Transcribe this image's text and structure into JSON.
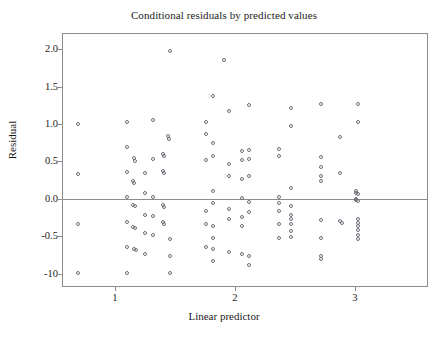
{
  "chart_data": {
    "type": "scatter",
    "title": "Conditional residuals by predicted values",
    "xlabel": "Linear predictor",
    "ylabel": "Residual",
    "xlim": [
      0.56,
      3.61
    ],
    "ylim": [
      -1.18,
      2.22
    ],
    "grid": false,
    "legend": null,
    "xticks": [
      1,
      2,
      3
    ],
    "xtick_labels": [
      "1",
      "2",
      "3"
    ],
    "yticks": [
      2.0,
      1.5,
      1.0,
      0.5,
      0.0,
      -0.5,
      -1.0
    ],
    "ytick_labels": [
      "2.0",
      "1.5",
      "1.0",
      "0.5",
      "0.0",
      "-0.5",
      "-10"
    ],
    "reference_lines": [
      {
        "orientation": "horizontal",
        "y": 0.0
      }
    ],
    "marker": "open-circle",
    "marker_color": "#6e6e78",
    "points": [
      [
        0.69,
        1.0
      ],
      [
        0.69,
        0.33
      ],
      [
        0.69,
        -0.33
      ],
      [
        0.69,
        -0.99
      ],
      [
        1.1,
        1.03
      ],
      [
        1.1,
        0.69
      ],
      [
        1.1,
        0.36
      ],
      [
        1.1,
        0.02
      ],
      [
        1.1,
        -0.31
      ],
      [
        1.1,
        -0.65
      ],
      [
        1.1,
        -0.99
      ],
      [
        1.16,
        0.55
      ],
      [
        1.17,
        0.51
      ],
      [
        1.15,
        0.24
      ],
      [
        1.16,
        0.21
      ],
      [
        1.15,
        -0.08
      ],
      [
        1.17,
        -0.09
      ],
      [
        1.15,
        -0.38
      ],
      [
        1.17,
        -0.39
      ],
      [
        1.16,
        -0.67
      ],
      [
        1.18,
        -0.68
      ],
      [
        1.25,
        0.35
      ],
      [
        1.25,
        0.08
      ],
      [
        1.25,
        -0.21
      ],
      [
        1.25,
        -0.46
      ],
      [
        1.25,
        -0.74
      ],
      [
        1.32,
        1.05
      ],
      [
        1.32,
        0.54
      ],
      [
        1.32,
        0.02
      ],
      [
        1.32,
        -0.23
      ],
      [
        1.32,
        -0.48
      ],
      [
        1.4,
        0.6
      ],
      [
        1.4,
        0.37
      ],
      [
        1.4,
        -0.08
      ],
      [
        1.4,
        -0.31
      ],
      [
        1.41,
        0.57
      ],
      [
        1.41,
        0.35
      ],
      [
        1.41,
        -0.11
      ],
      [
        1.41,
        -0.33
      ],
      [
        1.44,
        0.84
      ],
      [
        1.45,
        0.8
      ],
      [
        1.46,
        1.98
      ],
      [
        1.46,
        -0.54
      ],
      [
        1.46,
        -0.77
      ],
      [
        1.46,
        -0.99
      ],
      [
        1.76,
        1.03
      ],
      [
        1.76,
        0.87
      ],
      [
        1.76,
        0.52
      ],
      [
        1.76,
        -0.16
      ],
      [
        1.76,
        -0.33
      ],
      [
        1.76,
        -0.65
      ],
      [
        1.82,
        1.38
      ],
      [
        1.82,
        0.75
      ],
      [
        1.82,
        0.58
      ],
      [
        1.82,
        0.11
      ],
      [
        1.82,
        -0.05
      ],
      [
        1.82,
        -0.36
      ],
      [
        1.82,
        -0.52
      ],
      [
        1.82,
        -0.67
      ],
      [
        1.82,
        -0.83
      ],
      [
        1.91,
        1.86
      ],
      [
        1.95,
        1.18
      ],
      [
        1.95,
        0.46
      ],
      [
        1.95,
        0.31
      ],
      [
        1.95,
        -0.13
      ],
      [
        1.95,
        -0.27
      ],
      [
        1.95,
        -0.71
      ],
      [
        2.06,
        0.64
      ],
      [
        2.06,
        0.52
      ],
      [
        2.06,
        0.27
      ],
      [
        2.06,
        0.01
      ],
      [
        2.06,
        -0.24
      ],
      [
        2.06,
        -0.36
      ],
      [
        2.06,
        -0.74
      ],
      [
        2.12,
        1.26
      ],
      [
        2.12,
        0.66
      ],
      [
        2.12,
        0.54
      ],
      [
        2.12,
        0.31
      ],
      [
        2.12,
        -0.04
      ],
      [
        2.12,
        -0.17
      ],
      [
        2.12,
        -0.76
      ],
      [
        2.12,
        -0.88
      ],
      [
        2.37,
        0.67
      ],
      [
        2.37,
        0.58
      ],
      [
        2.37,
        0.02
      ],
      [
        2.37,
        -0.06
      ],
      [
        2.37,
        -0.16
      ],
      [
        2.37,
        -0.34
      ],
      [
        2.37,
        -0.53
      ],
      [
        2.47,
        1.21
      ],
      [
        2.47,
        0.97
      ],
      [
        2.47,
        0.15
      ],
      [
        2.47,
        -0.09
      ],
      [
        2.47,
        -0.21
      ],
      [
        2.47,
        -0.27
      ],
      [
        2.47,
        -0.33
      ],
      [
        2.47,
        -0.43
      ],
      [
        2.47,
        -0.51
      ],
      [
        2.72,
        1.27
      ],
      [
        2.72,
        0.56
      ],
      [
        2.72,
        0.43
      ],
      [
        2.72,
        0.3
      ],
      [
        2.72,
        0.24
      ],
      [
        2.72,
        -0.28
      ],
      [
        2.72,
        -0.53
      ],
      [
        2.72,
        -0.76
      ],
      [
        2.72,
        -0.81
      ],
      [
        2.88,
        0.83
      ],
      [
        2.88,
        0.34
      ],
      [
        2.88,
        -0.3
      ],
      [
        2.89,
        -0.32
      ],
      [
        3.03,
        1.27
      ],
      [
        3.03,
        1.03
      ],
      [
        3.03,
        0.06
      ],
      [
        3.03,
        -0.03
      ],
      [
        3.01,
        0.11
      ],
      [
        3.01,
        0.08
      ],
      [
        3.01,
        0.0
      ],
      [
        3.01,
        -0.02
      ],
      [
        3.03,
        -0.27
      ],
      [
        3.03,
        -0.32
      ],
      [
        3.03,
        -0.37
      ],
      [
        3.03,
        -0.42
      ],
      [
        3.03,
        -0.48
      ],
      [
        3.03,
        -0.54
      ]
    ]
  }
}
